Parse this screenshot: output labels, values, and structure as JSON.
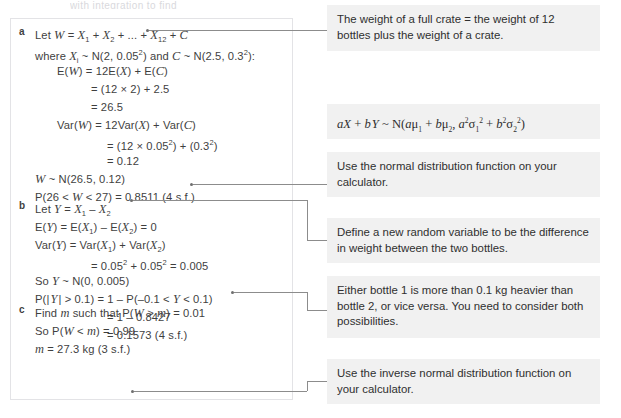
{
  "top_sliver": "with integration to find",
  "solution": {
    "parts": [
      {
        "label": "a",
        "lines": [
          {
            "indent": 0,
            "html": "Let <i class='v'>W</i> = <i class='v'>X</i><sub>1</sub> + <i class='v'>X</i><sub>2</sub> + ... + <i class='v'>X</i><sub>12</sub> + <i class='v'>C</i>"
          },
          {
            "indent": 0,
            "html": "where <i class='v'>X</i><sub>i</sub> ~ N(2, 0.05<sup>2</sup>) and <i class='v'>C</i> ~ N(2.5, 0.3<sup>2</sup>):"
          },
          {
            "indent": 1,
            "html": "E(<i class='v'>W</i>) = 12E(<i class='v'>X</i>) + E(<i class='v'>C</i>)"
          },
          {
            "indent": 2,
            "html": "= (12 &#215; 2) + 2.5"
          },
          {
            "indent": 2,
            "html": "= 26.5"
          },
          {
            "indent": 1,
            "html": "Var(<i class='v'>W</i>) = 12Var(<i class='v'>X</i>) + Var(<i class='v'>C</i>)"
          },
          {
            "indent": 3,
            "html": "= (12 &#215; 0.05<sup>2</sup>) + (0.3<sup>2</sup>)"
          },
          {
            "indent": 3,
            "html": "= 0.12"
          },
          {
            "indent": 0,
            "html": "<i class='v'>W</i> ~ N(26.5, 0.12)"
          },
          {
            "indent": 0,
            "html": "P(26 &lt; <i class='v'>W</i> &lt; 27) = 0.8511 (4 s.f.)"
          }
        ]
      },
      {
        "label": "b",
        "lines": [
          {
            "indent": 0,
            "html": "Let <i class='v'>Y</i> = <i class='v'>X</i><sub>1</sub> &#8211; <i class='v'>X</i><sub>2</sub>"
          },
          {
            "indent": 0,
            "html": "E(<i class='v'>Y</i>) = E(<i class='v'>X</i><sub>1</sub>) &#8211; E(<i class='v'>X</i><sub>2</sub>) = 0"
          },
          {
            "indent": 0,
            "html": "Var(<i class='v'>Y</i>) = Var(<i class='v'>X</i><sub>1</sub>) + Var(<i class='v'>X</i><sub>2</sub>)"
          },
          {
            "indent": 2,
            "html": "= 0.05<sup>2</sup> + 0.05<sup>2</sup> = 0.005"
          },
          {
            "indent": 0,
            "html": "So <i class='v'>Y</i> ~ N(0, 0.005)"
          },
          {
            "indent": 0,
            "html": "P(|&#8202;<i class='v'>Y</i>&#8202;| &gt; 0.1) = 1 &#8211; P(&#8211;0.1 &lt; <i class='v'>Y</i> &lt; 0.1)"
          },
          {
            "indent": 3,
            "html": "= 1 &#8211; 0.8427"
          },
          {
            "indent": 3,
            "html": "= 0.1573 (4 s.f.)"
          }
        ]
      },
      {
        "label": "c",
        "lines": [
          {
            "indent": 0,
            "html": "Find <i class='v'>m</i> such that P(<i class='v'>W</i> &gt; <i class='v'>m</i>) = 0.01"
          },
          {
            "indent": 0,
            "html": "So P(<i class='v'>W</i> &lt; <i class='v'>m</i>) = 0.99"
          },
          {
            "indent": 0,
            "html": "<i class='v'>m</i> = 27.3 kg (3 s.f.)"
          }
        ]
      }
    ]
  },
  "notes": {
    "crate": "The weight of a full crate = the weight of 12 bottles plus the weight of a crate.",
    "formula_html": "<i>aX</i> + <i>b</i>&#8202;<i>Y</i> ~ <span class='up'>N(</span><i>a</i>&#956;<sub>1</sub> + <i>b</i>&#956;<sub>2</sub>, <i>a</i><sup>2</sup>&#963;<sub>1</sub><sup>2</sup> + <i>b</i><sup>2</sup>&#963;<sub>2</sub><sup>2</sup><span class='up'>)</span>",
    "normal_fn": "Use the normal distribution function on your calculator.",
    "define_var": "Define a new random variable to be the difference in weight between the two bottles.",
    "both_tails": "Either bottle 1 is more than 0.1 kg heavier than bottle 2, or vice versa. You need to consider both possibilities.",
    "inverse_fn": "Use the inverse normal distribution function on your calculator."
  },
  "colors": {
    "note_background": "#f1f1f1",
    "box_border": "#e3e3e6",
    "connector": "#8c8c8c",
    "text": "#3f3f3f"
  }
}
